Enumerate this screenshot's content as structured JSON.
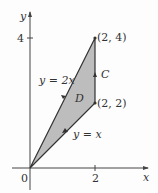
{
  "figure": {
    "axes": {
      "x_label": "x",
      "y_label": "y",
      "origin_label": "0",
      "x_tick_label": "2",
      "y_tick_label": "4"
    },
    "points": {
      "top": "(2, 4)",
      "mid": "(2, 2)"
    },
    "curves": {
      "upper": "y = 2x",
      "lower": "y = x",
      "boundary": "C",
      "region": "D"
    },
    "colors": {
      "region_fill": "#bdbdbd",
      "line": "#333333"
    }
  }
}
